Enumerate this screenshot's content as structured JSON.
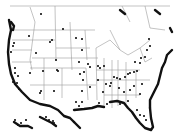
{
  "map": {
    "title": "",
    "region": "United States and southern Canada",
    "legend": [],
    "marker_color": "#111111",
    "border_color": "#9a9a9a",
    "coast_color": "#111111"
  },
  "dots": [
    [
      41,
      14
    ],
    [
      63,
      29
    ],
    [
      52,
      40
    ],
    [
      29,
      36
    ],
    [
      13,
      46
    ],
    [
      11,
      52
    ],
    [
      14,
      43
    ],
    [
      36,
      53
    ],
    [
      50,
      42
    ],
    [
      56,
      60
    ],
    [
      82,
      39
    ],
    [
      76,
      38
    ],
    [
      82,
      50
    ],
    [
      79,
      62
    ],
    [
      15,
      68
    ],
    [
      15,
      73
    ],
    [
      18,
      76
    ],
    [
      13,
      82
    ],
    [
      17,
      83
    ],
    [
      19,
      89
    ],
    [
      30,
      73
    ],
    [
      43,
      71
    ],
    [
      58,
      71
    ],
    [
      40,
      93
    ],
    [
      41,
      91
    ],
    [
      54,
      91
    ],
    [
      57,
      70
    ],
    [
      88,
      64
    ],
    [
      90,
      67
    ],
    [
      84,
      72
    ],
    [
      80,
      74
    ],
    [
      83,
      80
    ],
    [
      82,
      91
    ],
    [
      90,
      87
    ],
    [
      82,
      102
    ],
    [
      76,
      102
    ],
    [
      79,
      106
    ],
    [
      98,
      66
    ],
    [
      100,
      68
    ],
    [
      104,
      66
    ],
    [
      98,
      80
    ],
    [
      106,
      84
    ],
    [
      103,
      92
    ],
    [
      111,
      83
    ],
    [
      114,
      77
    ],
    [
      117,
      78
    ],
    [
      120,
      79
    ],
    [
      125,
      77
    ],
    [
      128,
      74
    ],
    [
      130,
      73
    ],
    [
      134,
      72
    ],
    [
      137,
      71
    ],
    [
      135,
      62
    ],
    [
      140,
      63
    ],
    [
      141,
      58
    ],
    [
      145,
      57
    ],
    [
      147,
      50
    ],
    [
      150,
      46
    ],
    [
      149,
      39
    ],
    [
      110,
      86
    ],
    [
      119,
      88
    ],
    [
      124,
      92
    ],
    [
      130,
      90
    ],
    [
      134,
      86
    ],
    [
      142,
      84
    ],
    [
      140,
      94
    ],
    [
      128,
      101
    ],
    [
      120,
      104
    ],
    [
      107,
      104
    ],
    [
      99,
      103
    ],
    [
      137,
      110
    ],
    [
      140,
      115
    ],
    [
      144,
      116
    ],
    [
      146,
      120
    ],
    [
      15,
      120
    ],
    [
      18,
      125
    ],
    [
      21,
      123
    ],
    [
      26,
      120
    ],
    [
      46,
      117
    ],
    [
      49,
      120
    ],
    [
      53,
      121
    ],
    [
      54,
      123
    ]
  ]
}
